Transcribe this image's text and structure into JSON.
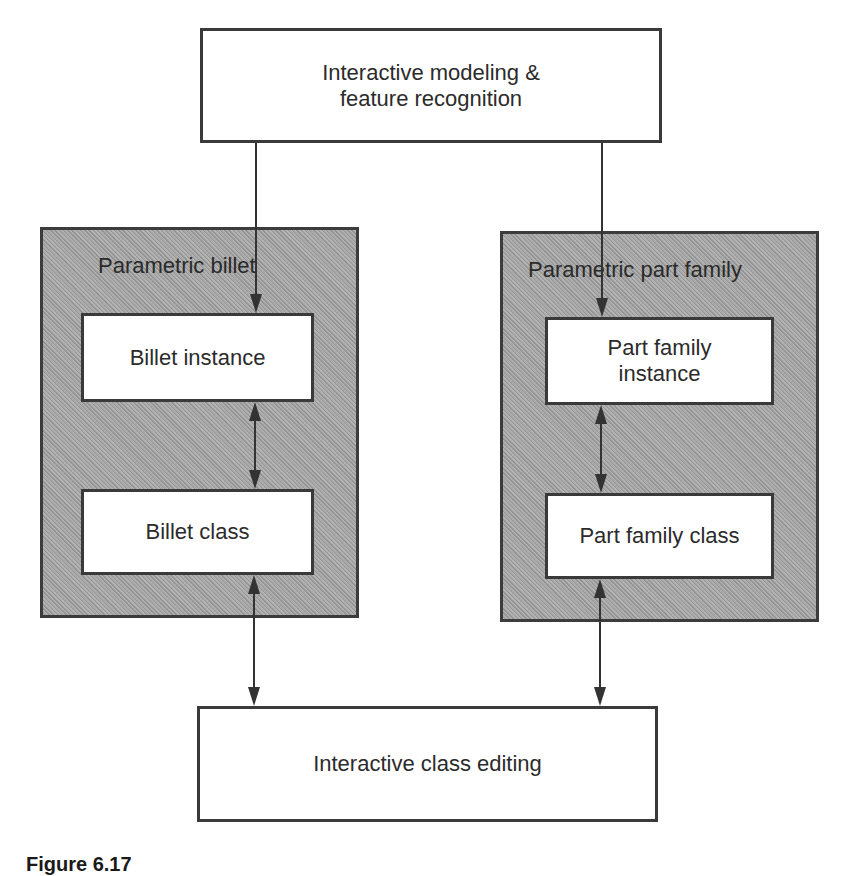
{
  "diagram": {
    "top_box": {
      "label": "Interactive modeling &\nfeature recognition"
    },
    "left_group": {
      "label": "Parametric billet",
      "instance_box": {
        "label": "Billet instance"
      },
      "class_box": {
        "label": "Billet class"
      }
    },
    "right_group": {
      "label": "Parametric part family",
      "instance_box": {
        "label": "Part family\ninstance"
      },
      "class_box": {
        "label": "Part family class"
      }
    },
    "bottom_box": {
      "label": "Interactive class editing"
    },
    "connections": [
      {
        "from": "Interactive modeling & feature recognition",
        "to": "Billet instance",
        "direction": "one-way"
      },
      {
        "from": "Interactive modeling & feature recognition",
        "to": "Part family instance",
        "direction": "one-way"
      },
      {
        "from": "Billet instance",
        "to": "Billet class",
        "direction": "bidirectional"
      },
      {
        "from": "Part family instance",
        "to": "Part family class",
        "direction": "bidirectional"
      },
      {
        "from": "Billet class",
        "to": "Interactive class editing",
        "direction": "bidirectional"
      },
      {
        "from": "Part family class",
        "to": "Interactive class editing",
        "direction": "bidirectional"
      }
    ],
    "colors": {
      "line": "#333333",
      "group_fill": "#a4a4a4",
      "box_fill": "#ffffff"
    }
  },
  "caption": {
    "figure_number": "Figure 6.17"
  }
}
